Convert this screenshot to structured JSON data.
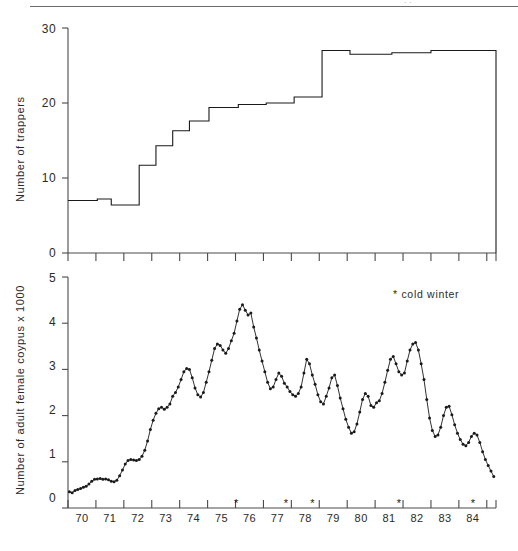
{
  "figure": {
    "panels": [
      {
        "id": "trappers",
        "ylabel": "Number of trappers",
        "yticks": [
          "0",
          "10",
          "20",
          "30"
        ]
      },
      {
        "id": "coypu",
        "ylabel": "Number of adult female coypus x 1000",
        "yticks": [
          "0",
          "1",
          "2",
          "3",
          "4",
          "5"
        ],
        "legend_label": "cold winter",
        "legend_symbol": "*"
      }
    ],
    "xticks": [
      "70",
      "71",
      "72",
      "73",
      "74",
      "75",
      "76",
      "77",
      "78",
      "79",
      "80",
      "81",
      "82",
      "83",
      "84"
    ],
    "corner_mark": "··",
    "colors": {
      "ink": "#1a1a1a",
      "axis": "#4a4a4a",
      "rule": "#6b6b6b",
      "background": "#ffffff"
    }
  },
  "chart_data": [
    {
      "type": "line",
      "subtype": "step",
      "title": "Number of trappers",
      "xlabel": "",
      "ylabel": "Number of trappers",
      "ylim": [
        0,
        30
      ],
      "xlim": [
        1969.5,
        1984.83
      ],
      "yticks": [
        0,
        10,
        20,
        30
      ],
      "grid": false,
      "legend": "none",
      "note": "Step function: number of coypu trappers employed per period, 1970-1984",
      "steps": [
        {
          "x_start": 1969.5,
          "x_end": 1970.55,
          "value": 7.0
        },
        {
          "x_start": 1970.55,
          "x_end": 1971.05,
          "value": 7.2
        },
        {
          "x_start": 1971.05,
          "x_end": 1972.05,
          "value": 6.4
        },
        {
          "x_start": 1972.05,
          "x_end": 1972.65,
          "value": 11.7
        },
        {
          "x_start": 1972.65,
          "x_end": 1973.25,
          "value": 14.3
        },
        {
          "x_start": 1973.25,
          "x_end": 1973.85,
          "value": 16.3
        },
        {
          "x_start": 1973.85,
          "x_end": 1974.55,
          "value": 17.6
        },
        {
          "x_start": 1974.55,
          "x_end": 1975.6,
          "value": 19.4
        },
        {
          "x_start": 1975.6,
          "x_end": 1976.6,
          "value": 19.8
        },
        {
          "x_start": 1976.6,
          "x_end": 1977.6,
          "value": 20.0
        },
        {
          "x_start": 1977.6,
          "x_end": 1978.6,
          "value": 20.8
        },
        {
          "x_start": 1978.6,
          "x_end": 1979.6,
          "value": 27.0
        },
        {
          "x_start": 1979.6,
          "x_end": 1981.1,
          "value": 26.5
        },
        {
          "x_start": 1981.1,
          "x_end": 1982.5,
          "value": 26.7
        },
        {
          "x_start": 1982.5,
          "x_end": 1984.83,
          "value": 27.0
        }
      ]
    },
    {
      "type": "line",
      "subtype": "markers",
      "title": "Number of adult female coypus x 1000",
      "xlabel": "",
      "ylabel": "Number of adult female coypus x 1000",
      "ylim": [
        0,
        5
      ],
      "xlim": [
        1969.5,
        1984.83
      ],
      "yticks": [
        0,
        1,
        2,
        3,
        4,
        5
      ],
      "grid": false,
      "legend": "* cold winter (top right)",
      "annotations": [
        {
          "symbol": "*",
          "x": 1975.52,
          "label": "cold winter"
        },
        {
          "symbol": "*",
          "x": 1977.3,
          "label": "cold winter"
        },
        {
          "symbol": "*",
          "x": 1978.25,
          "label": "cold winter"
        },
        {
          "symbol": "*",
          "x": 1981.35,
          "label": "cold winter"
        },
        {
          "symbol": "*",
          "x": 1984.0,
          "label": "cold winter"
        }
      ],
      "x": [
        1969.55,
        1969.65,
        1969.75,
        1969.85,
        1969.95,
        1970.05,
        1970.15,
        1970.25,
        1970.35,
        1970.45,
        1970.55,
        1970.65,
        1970.75,
        1970.85,
        1970.95,
        1971.05,
        1971.15,
        1971.25,
        1971.35,
        1971.45,
        1971.55,
        1971.65,
        1971.75,
        1971.85,
        1971.95,
        1972.05,
        1972.15,
        1972.25,
        1972.35,
        1972.45,
        1972.55,
        1972.65,
        1972.75,
        1972.85,
        1972.95,
        1973.05,
        1973.15,
        1973.25,
        1973.35,
        1973.45,
        1973.55,
        1973.65,
        1973.75,
        1973.85,
        1973.95,
        1974.05,
        1974.15,
        1974.25,
        1974.35,
        1974.45,
        1974.55,
        1974.65,
        1974.75,
        1974.85,
        1974.95,
        1975.05,
        1975.15,
        1975.25,
        1975.35,
        1975.45,
        1975.55,
        1975.65,
        1975.75,
        1975.85,
        1975.95,
        1976.05,
        1976.15,
        1976.25,
        1976.35,
        1976.45,
        1976.55,
        1976.65,
        1976.75,
        1976.85,
        1976.95,
        1977.05,
        1977.15,
        1977.25,
        1977.35,
        1977.45,
        1977.55,
        1977.65,
        1977.75,
        1977.85,
        1977.95,
        1978.05,
        1978.15,
        1978.25,
        1978.35,
        1978.45,
        1978.55,
        1978.65,
        1978.75,
        1978.85,
        1978.95,
        1979.05,
        1979.15,
        1979.25,
        1979.35,
        1979.45,
        1979.55,
        1979.65,
        1979.75,
        1979.85,
        1979.95,
        1980.05,
        1980.15,
        1980.25,
        1980.35,
        1980.45,
        1980.55,
        1980.65,
        1980.75,
        1980.85,
        1980.95,
        1981.05,
        1981.15,
        1981.25,
        1981.35,
        1981.45,
        1981.55,
        1981.65,
        1981.75,
        1981.85,
        1981.95,
        1982.05,
        1982.15,
        1982.25,
        1982.35,
        1982.45,
        1982.55,
        1982.65,
        1982.75,
        1982.85,
        1982.95,
        1983.05,
        1983.15,
        1983.25,
        1983.35,
        1983.45,
        1983.55,
        1983.65,
        1983.75,
        1983.85,
        1983.95,
        1984.05,
        1984.15,
        1984.25,
        1984.35,
        1984.45,
        1984.55,
        1984.65,
        1984.75
      ],
      "y": [
        0.35,
        0.33,
        0.38,
        0.4,
        0.42,
        0.45,
        0.47,
        0.52,
        0.58,
        0.62,
        0.63,
        0.64,
        0.62,
        0.63,
        0.61,
        0.58,
        0.57,
        0.6,
        0.7,
        0.82,
        0.95,
        1.03,
        1.05,
        1.04,
        1.03,
        1.05,
        1.12,
        1.25,
        1.45,
        1.7,
        1.9,
        2.05,
        2.15,
        2.18,
        2.14,
        2.18,
        2.25,
        2.42,
        2.5,
        2.62,
        2.78,
        2.95,
        3.02,
        3.0,
        2.82,
        2.6,
        2.45,
        2.4,
        2.5,
        2.72,
        2.95,
        3.2,
        3.45,
        3.55,
        3.52,
        3.42,
        3.35,
        3.45,
        3.62,
        3.78,
        4.05,
        4.3,
        4.4,
        4.28,
        4.18,
        4.22,
        3.92,
        3.68,
        3.42,
        3.18,
        2.95,
        2.72,
        2.58,
        2.62,
        2.78,
        2.92,
        2.85,
        2.7,
        2.62,
        2.52,
        2.45,
        2.42,
        2.48,
        2.62,
        2.92,
        3.22,
        3.12,
        2.88,
        2.68,
        2.45,
        2.3,
        2.25,
        2.42,
        2.6,
        2.82,
        2.88,
        2.65,
        2.38,
        2.15,
        1.92,
        1.75,
        1.62,
        1.65,
        1.82,
        2.08,
        2.35,
        2.48,
        2.42,
        2.22,
        2.18,
        2.28,
        2.32,
        2.48,
        2.72,
        2.98,
        3.22,
        3.28,
        3.12,
        2.95,
        2.88,
        2.92,
        3.18,
        3.42,
        3.55,
        3.58,
        3.42,
        3.12,
        2.78,
        2.35,
        1.95,
        1.68,
        1.55,
        1.58,
        1.75,
        2.0,
        2.18,
        2.2,
        2.02,
        1.8,
        1.62,
        1.48,
        1.38,
        1.35,
        1.42,
        1.55,
        1.62,
        1.58,
        1.42,
        1.22,
        1.05,
        0.92,
        0.8,
        0.68,
        0.58,
        0.55,
        0.57,
        0.55,
        0.52,
        0.48,
        0.38,
        0.3
      ]
    }
  ]
}
